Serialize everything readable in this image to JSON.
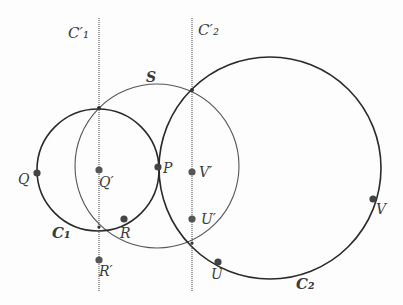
{
  "diagram": {
    "circles": [
      {
        "id": "C1",
        "label": "C",
        "subscript": "1",
        "cx": 98,
        "cy": 170,
        "r": 61,
        "stroke": "#2a2a2a",
        "width": 1.6
      },
      {
        "id": "S",
        "label": "S",
        "cx": 157,
        "cy": 166,
        "r": 82,
        "stroke": "#555555",
        "width": 1.1
      },
      {
        "id": "C2",
        "label": "C",
        "subscript": "2",
        "cx": 270,
        "cy": 168,
        "r": 111,
        "stroke": "#2a2a2a",
        "width": 1.6
      }
    ],
    "lines": [
      {
        "id": "C1prime",
        "label": "C",
        "subscript": "1",
        "prime": "′",
        "x": 99,
        "y1": 18,
        "y2": 292
      },
      {
        "id": "C2prime",
        "label": "C",
        "subscript": "2",
        "prime": "′",
        "x": 192,
        "y1": 18,
        "y2": 292
      }
    ],
    "points": [
      {
        "id": "Q",
        "label": "Q",
        "x": 37,
        "y": 173
      },
      {
        "id": "Qprime",
        "label": "Q′",
        "x": 99,
        "y": 170
      },
      {
        "id": "P",
        "label": "P",
        "x": 158,
        "y": 167
      },
      {
        "id": "Vprime",
        "label": "V′",
        "x": 192,
        "y": 172
      },
      {
        "id": "R",
        "label": "R",
        "x": 124,
        "y": 219
      },
      {
        "id": "Uprime",
        "label": "U′",
        "x": 192,
        "y": 219
      },
      {
        "id": "Rprime",
        "label": "R′",
        "x": 99,
        "y": 260
      },
      {
        "id": "U",
        "label": "U",
        "x": 218,
        "y": 262
      },
      {
        "id": "V",
        "label": "V",
        "x": 373,
        "y": 199
      }
    ],
    "labels": {
      "C1prime": "C′₁",
      "C2prime": "C′₂",
      "S": "S",
      "C1": "C₁",
      "C2": "C₂",
      "Q": "Q",
      "Qprime": "Q′",
      "P": "P",
      "Vprime": "V′",
      "R": "R",
      "Uprime": "U′",
      "Rprime": "R′",
      "U": "U",
      "V": "V"
    },
    "colors": {
      "ink": "#2a2a2a",
      "dotted_line": "#777777",
      "point": "#444444"
    }
  }
}
